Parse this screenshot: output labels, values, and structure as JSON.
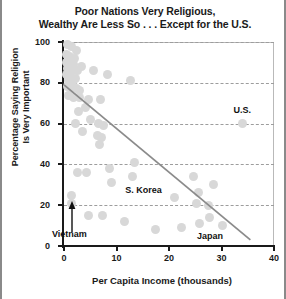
{
  "chart": {
    "title_lines": [
      "Poor Nations Very Religious,",
      "Wealthy Are Less So . . . Except for the U.S."
    ],
    "ylabel_lines": [
      "Percentage Saying Religion",
      "Is Very Important"
    ],
    "xlabel": "Per Capita Income (thousands)",
    "marker_color": "#d8d8d8",
    "trendline_color": "#8b8b8b",
    "grid_color": "#9d9d9d",
    "axis_color": "#1a1a1a"
  },
  "chart_data": {
    "type": "scatter",
    "title": "Poor Nations Very Religious, Wealthy Are Less So . . . Except for the U.S.",
    "xlabel": "Per Capita Income (thousands)",
    "ylabel": "Percentage Saying Religion Is Very Important",
    "xlim": [
      0,
      40
    ],
    "ylim": [
      0,
      100
    ],
    "xticks": [
      0,
      10,
      20,
      30,
      40
    ],
    "yticks": [
      0,
      20,
      40,
      60,
      80,
      100
    ],
    "grid": true,
    "legend": false,
    "points": [
      {
        "x": 0.6,
        "y": 99
      },
      {
        "x": 1.4,
        "y": 98
      },
      {
        "x": 2.4,
        "y": 96
      },
      {
        "x": 0.5,
        "y": 94
      },
      {
        "x": 1.1,
        "y": 93
      },
      {
        "x": 2.0,
        "y": 92
      },
      {
        "x": 0.4,
        "y": 90
      },
      {
        "x": 1.3,
        "y": 90
      },
      {
        "x": 1.9,
        "y": 89
      },
      {
        "x": 3.4,
        "y": 88
      },
      {
        "x": 0.7,
        "y": 87
      },
      {
        "x": 1.6,
        "y": 86
      },
      {
        "x": 2.6,
        "y": 86
      },
      {
        "x": 5.6,
        "y": 86
      },
      {
        "x": 0.5,
        "y": 84
      },
      {
        "x": 1.2,
        "y": 83
      },
      {
        "x": 2.1,
        "y": 82
      },
      {
        "x": 0.9,
        "y": 81
      },
      {
        "x": 1.7,
        "y": 80
      },
      {
        "x": 8.2,
        "y": 84
      },
      {
        "x": 0.6,
        "y": 78
      },
      {
        "x": 1.5,
        "y": 77
      },
      {
        "x": 2.3,
        "y": 77
      },
      {
        "x": 3.0,
        "y": 76
      },
      {
        "x": 12.6,
        "y": 81
      },
      {
        "x": 0.8,
        "y": 74
      },
      {
        "x": 1.8,
        "y": 73
      },
      {
        "x": 2.9,
        "y": 73
      },
      {
        "x": 4.6,
        "y": 72
      },
      {
        "x": 6.9,
        "y": 72
      },
      {
        "x": 4.1,
        "y": 68
      },
      {
        "x": 2.7,
        "y": 66
      },
      {
        "x": 5.1,
        "y": 62
      },
      {
        "x": 2.2,
        "y": 60
      },
      {
        "x": 6.6,
        "y": 60
      },
      {
        "x": 7.5,
        "y": 59
      },
      {
        "x": 3.6,
        "y": 56
      },
      {
        "x": 6.4,
        "y": 54
      },
      {
        "x": 7.1,
        "y": 53
      },
      {
        "x": 6.8,
        "y": 50
      },
      {
        "x": 34.0,
        "y": 60
      },
      {
        "x": 13.5,
        "y": 41
      },
      {
        "x": 8.6,
        "y": 38
      },
      {
        "x": 2.6,
        "y": 36
      },
      {
        "x": 4.3,
        "y": 36
      },
      {
        "x": 13.0,
        "y": 34
      },
      {
        "x": 24.6,
        "y": 34
      },
      {
        "x": 9.1,
        "y": 31
      },
      {
        "x": 28.4,
        "y": 30
      },
      {
        "x": 1.5,
        "y": 25
      },
      {
        "x": 25.6,
        "y": 26
      },
      {
        "x": 21.0,
        "y": 24
      },
      {
        "x": 1.5,
        "y": 21
      },
      {
        "x": 25.2,
        "y": 21
      },
      {
        "x": 27.6,
        "y": 20
      },
      {
        "x": 4.6,
        "y": 15
      },
      {
        "x": 7.4,
        "y": 15
      },
      {
        "x": 27.8,
        "y": 14
      },
      {
        "x": 11.5,
        "y": 12
      },
      {
        "x": 25.8,
        "y": 11
      },
      {
        "x": 30.2,
        "y": 10
      },
      {
        "x": 22.3,
        "y": 9
      },
      {
        "x": 17.5,
        "y": 8
      }
    ],
    "trendline": {
      "x_start": 0.0,
      "y_start": 79.0,
      "x_end": 35.5,
      "y_end": 3.0
    },
    "annotations": [
      {
        "label": "U.S.",
        "x": 34.0,
        "y": 60,
        "note": "labeled point above marker"
      },
      {
        "label": "S. Korea",
        "x": 21.0,
        "y": 24,
        "note": "label left of cluster"
      },
      {
        "label": "Japan",
        "x": 27.8,
        "y": 14,
        "note": "label below right cluster"
      },
      {
        "label": "Vietnam",
        "x": 1.5,
        "y": 21,
        "note": "label below, arrow points up to marker"
      }
    ]
  }
}
